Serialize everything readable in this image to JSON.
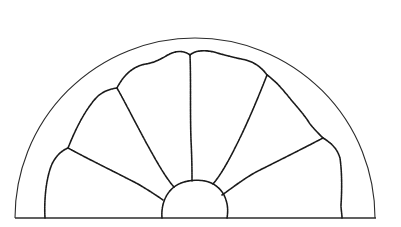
{
  "figure": {
    "colors": {
      "background": "#ffffff",
      "line": "#1a1a1a"
    },
    "outer_arc": {
      "cx": 195,
      "cy": 218,
      "r": 180
    },
    "baseline": {
      "x1": 15,
      "x2": 376,
      "y": 218
    },
    "hub": {
      "cx": 193,
      "cy": 218,
      "r": 31
    },
    "pane_count": 6
  }
}
